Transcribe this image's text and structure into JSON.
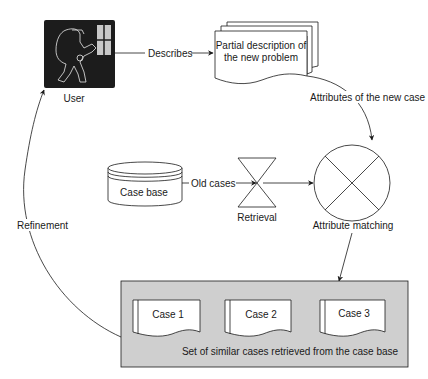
{
  "diagram": {
    "nodes": {
      "user": {
        "label": "User",
        "icon": "user-at-terminal-icon"
      },
      "problem_description": {
        "label_line1": "Partial description of",
        "label_line2": "the new problem"
      },
      "attribute_matching": {
        "label": "Attribute matching"
      },
      "case_base": {
        "label": "Case base"
      },
      "retrieval": {
        "label": "Retrieval"
      },
      "similar_cases": {
        "caption": "Set of similar cases retrieved from the case base",
        "cases": [
          "Case 1",
          "Case 2",
          "Case 3"
        ]
      }
    },
    "edges": {
      "describes": "Describes",
      "attributes_new_case": "Attributes of the new case",
      "old_cases": "Old cases",
      "refinement": "Refinement"
    },
    "colors": {
      "stroke": "#1a1a1a",
      "user_box": "#1c1c1c",
      "results_box": "#cfcfcf",
      "paper": "#ffffff"
    }
  }
}
